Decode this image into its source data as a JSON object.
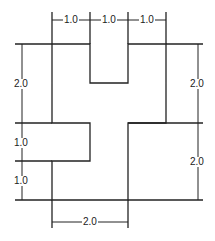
{
  "diagram": {
    "type": "dimensioned-shape",
    "stroke_color": "#222222",
    "dimensions": {
      "top_left": "1.0",
      "top_middle": "1.0",
      "top_right": "1.0",
      "left_upper": "2.0",
      "left_middle": "1.0",
      "left_lower": "1.0",
      "right_upper": "2.0",
      "right_lower": "2.0",
      "bottom": "2.0"
    }
  }
}
